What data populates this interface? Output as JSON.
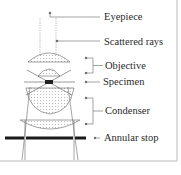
{
  "diagram": {
    "labels": {
      "eyepiece": "Eyepiece",
      "scattered_rays": "Scattered rays",
      "objective": "Objective",
      "specimen": "Specimen",
      "condenser": "Condenser",
      "annular_stop": "Annular stop"
    },
    "colors": {
      "line": "#555555",
      "stop": "#1a1a1a",
      "frame": "#bbbbbb",
      "text": "#2a2a2a"
    }
  }
}
